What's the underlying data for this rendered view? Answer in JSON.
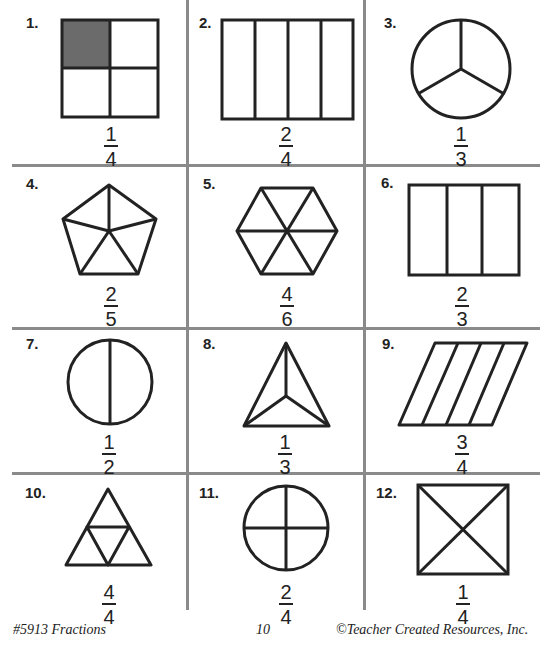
{
  "problems": [
    {
      "number": "1.",
      "shape": "square-quarters-one-shaded",
      "numerator": "1",
      "denominator": "4"
    },
    {
      "number": "2.",
      "shape": "rectangle-four-columns",
      "numerator": "2",
      "denominator": "4"
    },
    {
      "number": "3.",
      "shape": "circle-thirds",
      "numerator": "1",
      "denominator": "3"
    },
    {
      "number": "4.",
      "shape": "pentagon-fifths",
      "numerator": "2",
      "denominator": "5"
    },
    {
      "number": "5.",
      "shape": "hexagon-sixths",
      "numerator": "4",
      "denominator": "6"
    },
    {
      "number": "6.",
      "shape": "rectangle-three-columns",
      "numerator": "2",
      "denominator": "3"
    },
    {
      "number": "7.",
      "shape": "circle-halves",
      "numerator": "1",
      "denominator": "2"
    },
    {
      "number": "8.",
      "shape": "triangle-thirds",
      "numerator": "1",
      "denominator": "3"
    },
    {
      "number": "9.",
      "shape": "parallelogram-fourths",
      "numerator": "3",
      "denominator": "4"
    },
    {
      "number": "10.",
      "shape": "triangle-four-subtriangles",
      "numerator": "4",
      "denominator": "4"
    },
    {
      "number": "11.",
      "shape": "circle-quarters",
      "numerator": "2",
      "denominator": "4"
    },
    {
      "number": "12.",
      "shape": "square-diagonal-quarters",
      "numerator": "1",
      "denominator": "4"
    }
  ],
  "footer": {
    "left": "#5913 Fractions",
    "center": "10",
    "right": "©Teacher Created Resources, Inc."
  },
  "colors": {
    "shaded": "#6b6b6b",
    "grid": "#8a8a8a",
    "ink": "#222222"
  }
}
